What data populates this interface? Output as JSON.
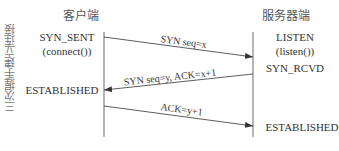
{
  "diagram": {
    "title_side": "三次握手建立连接",
    "client": {
      "header": "客户端",
      "states": [
        "SYN_SENT",
        "(connect())",
        "ESTABLISHED"
      ]
    },
    "server": {
      "header": "服务器端",
      "states": [
        "LISTEN",
        "(listen())",
        "SYN_RCVD",
        "ESTABLISHED"
      ]
    },
    "messages": [
      {
        "label": "SYN seq=x",
        "from": "client",
        "to": "server"
      },
      {
        "label": "SYN seq=y, ACK=x+1",
        "from": "server",
        "to": "client"
      },
      {
        "label": "ACK=y+1",
        "from": "client",
        "to": "server"
      }
    ],
    "colors": {
      "line": "#333333",
      "text": "#333333",
      "side_text": "#777777"
    }
  }
}
